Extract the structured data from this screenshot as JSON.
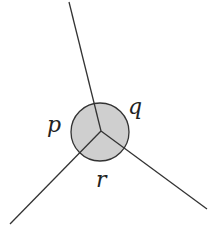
{
  "diagram": {
    "labels": {
      "p": "p",
      "q": "q",
      "r": "r"
    },
    "colors": {
      "line": "#333333",
      "fill": "#cfcfcf"
    }
  }
}
